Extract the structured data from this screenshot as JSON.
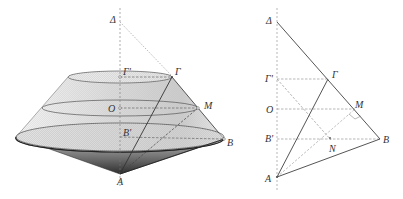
{
  "left_figure": {
    "description": "3D solid of revolution: frustum of cone on top of inverted cone",
    "labels": {
      "delta": "Δ",
      "gamma_prime": "Γ'",
      "gamma": "Γ",
      "o": "O",
      "m": "M",
      "b_prime": "B'",
      "b": "B",
      "a": "A"
    }
  },
  "right_figure": {
    "description": "2D cross-section of the solid",
    "labels": {
      "delta": "Δ",
      "gamma_prime": "Γ'",
      "gamma": "Γ",
      "o": "O",
      "m": "M",
      "b_prime": "B'",
      "b": "B",
      "n": "N",
      "a": "A"
    }
  },
  "colors": {
    "line": "#555555",
    "dashed": "#777777",
    "fill_light": "#e2e2e2",
    "fill_dark": "#3a3a3a"
  }
}
